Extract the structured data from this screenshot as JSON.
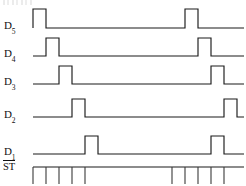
{
  "figure": {
    "type": "timing-diagram",
    "width": 246,
    "height": 186,
    "background_color": "#ffffff",
    "line_color": "#1a1a1a",
    "tick_color": "#3a3a3a"
  },
  "signals": [
    {
      "id": "d5",
      "label_base": "D",
      "label_sub": "5",
      "label_text": "D5",
      "baseline_y": 28,
      "high_y": 9,
      "label_x": 4,
      "label_y": 20,
      "pulses": [
        {
          "start": 33,
          "end": 46
        },
        {
          "start": 185,
          "end": 198
        }
      ]
    },
    {
      "id": "d4",
      "label_base": "D",
      "label_sub": "4",
      "label_text": "D4",
      "baseline_y": 56,
      "high_y": 38,
      "label_x": 4,
      "label_y": 48,
      "pulses": [
        {
          "start": 46,
          "end": 59
        },
        {
          "start": 198,
          "end": 211
        }
      ]
    },
    {
      "id": "d3",
      "label_base": "D",
      "label_sub": "3",
      "label_text": "D3",
      "baseline_y": 84,
      "high_y": 66,
      "label_x": 4,
      "label_y": 76,
      "pulses": [
        {
          "start": 59,
          "end": 72
        },
        {
          "start": 211,
          "end": 224
        }
      ]
    },
    {
      "id": "d2",
      "label_base": "D",
      "label_sub": "2",
      "label_text": "D2",
      "baseline_y": 117,
      "high_y": 99,
      "label_x": 4,
      "label_y": 109,
      "pulses": [
        {
          "start": 72,
          "end": 85
        },
        {
          "start": 224,
          "end": 237
        }
      ]
    },
    {
      "id": "d1",
      "label_base": "D",
      "label_sub": "1",
      "label_text": "D1",
      "baseline_y": 154,
      "high_y": 136,
      "label_x": 4,
      "label_y": 146,
      "pulses": [
        {
          "start": 85,
          "end": 98
        },
        {
          "start": 211,
          "end": 224
        }
      ]
    }
  ],
  "clock": {
    "id": "st",
    "label_text": "ST",
    "label_overline": true,
    "label_x": 3,
    "label_y": 160,
    "baseline_y": 167,
    "baseline_start": 33,
    "baseline_end": 244,
    "tick_height": 17,
    "tick_positions": [
      33,
      46,
      59,
      72,
      85,
      172,
      185,
      198,
      211,
      224
    ]
  }
}
